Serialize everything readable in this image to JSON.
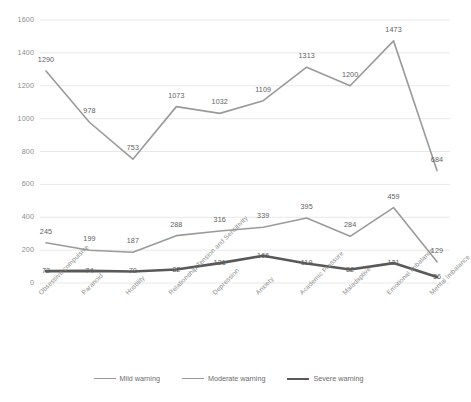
{
  "chart_data": {
    "type": "line",
    "title": "",
    "xlabel": "",
    "ylabel": "",
    "ylim": [
      0,
      1600
    ],
    "yticks": [
      0,
      200,
      400,
      600,
      800,
      1000,
      1200,
      1400,
      1600
    ],
    "grid": true,
    "legend_position": "bottom",
    "categories": [
      "Obsessive compulsive",
      "Paranoid",
      "Hostility",
      "Relationship Tension and Sensitivity",
      "Depression",
      "Anxiety",
      "Academic Pressure",
      "Maladaptive",
      "Emotional Imbalance",
      "Mental Imbalance"
    ],
    "series": [
      {
        "name": "Mild warning",
        "color": "#9a9a9a",
        "width": 1.6,
        "values": [
          245,
          199,
          187,
          288,
          316,
          339,
          395,
          284,
          459,
          129
        ]
      },
      {
        "name": "Moderate warning",
        "color": "#9a9a9a",
        "width": 1.6,
        "values": [
          1290,
          978,
          753,
          1073,
          1032,
          1109,
          1313,
          1200,
          1473,
          684
        ]
      },
      {
        "name": "Severe warning",
        "color": "#595959",
        "width": 2.6,
        "values": [
          72,
          74,
          70,
          82,
          121,
          166,
          119,
          82,
          121,
          36
        ]
      }
    ]
  },
  "legend": {
    "items": [
      {
        "label": "Mild warning",
        "color": "#9a9a9a",
        "width": 1.6
      },
      {
        "label": "Moderate warning",
        "color": "#9a9a9a",
        "width": 1.6
      },
      {
        "label": "Severe warning",
        "color": "#595959",
        "width": 2.6
      }
    ]
  }
}
